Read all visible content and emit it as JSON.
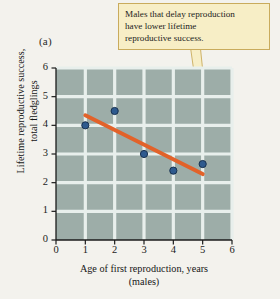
{
  "panel": {
    "label": "(a)"
  },
  "callout": {
    "lines": [
      "Males that delay reproduction",
      "have lower lifetime",
      "reproductive success."
    ],
    "fill_color": "#f7eec6",
    "border_color": "#c9ab5c"
  },
  "chart_data": {
    "type": "scatter",
    "title": "",
    "xlabel_lines": [
      "Age of first reproduction, years",
      "(males)"
    ],
    "ylabel_lines": [
      "Lifetime reproductive success,",
      "total fledglings"
    ],
    "xlim": [
      0,
      6
    ],
    "ylim": [
      0,
      6
    ],
    "xticks": [
      0,
      1,
      2,
      3,
      4,
      5,
      6
    ],
    "yticks": [
      0,
      1,
      2,
      3,
      4,
      5,
      6
    ],
    "xtick_labels": [
      "0",
      "1",
      "2",
      "3",
      "4",
      "5",
      "6"
    ],
    "ytick_labels": [
      "0",
      "1",
      "2",
      "3",
      "4",
      "5",
      "6"
    ],
    "grid": true,
    "legend": "none",
    "plot_background": "#9dada8",
    "grid_color": "#e8efec",
    "point_color": "#2e5a8e",
    "point_edge_color": "#17314f",
    "trendline_color": "#e2622a",
    "points": [
      {
        "x": 1,
        "y": 4.0
      },
      {
        "x": 2,
        "y": 4.5
      },
      {
        "x": 3,
        "y": 3.0
      },
      {
        "x": 4,
        "y": 2.42
      },
      {
        "x": 5,
        "y": 2.65
      }
    ],
    "trendline": {
      "x1": 1.0,
      "y1": 4.35,
      "x2": 5.0,
      "y2": 2.3
    }
  }
}
